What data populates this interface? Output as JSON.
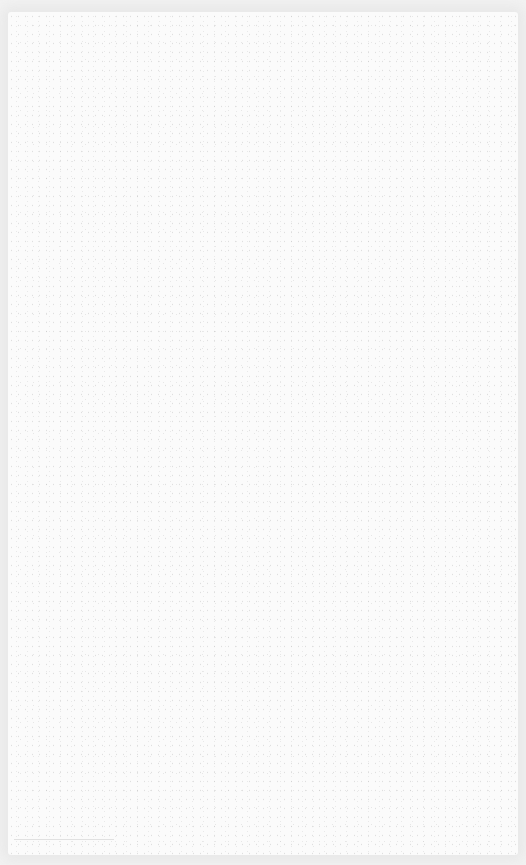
{
  "screen": {
    "state": "blank",
    "background_color": "#fbfbfb",
    "border_color": "#e9e9e9"
  }
}
